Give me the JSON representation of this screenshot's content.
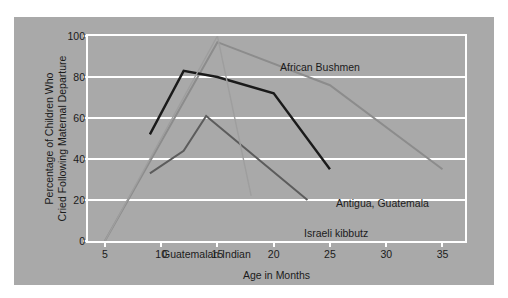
{
  "chart_data": {
    "type": "line",
    "title": "",
    "xlabel": "Age in Months",
    "ylabel": "Percentage of Children Who\nCried Following Maternal Departure",
    "ylabel_line1": "Percentage of Children Who",
    "ylabel_line2": "Cried Following Maternal Departure",
    "xlim": [
      3.5,
      37
    ],
    "ylim": [
      0,
      100
    ],
    "xticks": [
      5,
      10,
      15,
      20,
      25,
      30,
      35
    ],
    "yticks": [
      0,
      20,
      40,
      60,
      80,
      100
    ],
    "grid": true,
    "legend_position": "inline-annotations",
    "background_color": "#a9a9a9",
    "gridline_color": "#ffffff",
    "series": [
      {
        "name": "African Bushmen",
        "color": "#8c8c8c",
        "width": 2.0,
        "points": [
          [
            5,
            0
          ],
          [
            15,
            97
          ],
          [
            25,
            76
          ],
          [
            35,
            35
          ]
        ],
        "label": {
          "text": "African Bushmen",
          "x_px": 266,
          "y_px": 45
        }
      },
      {
        "name": "Antigua, Guatemala",
        "color": "#1a1a1a",
        "width": 2.4,
        "points": [
          [
            9,
            52
          ],
          [
            12,
            83
          ],
          [
            15,
            80
          ],
          [
            20,
            72
          ],
          [
            25,
            35
          ]
        ],
        "label": {
          "text": "Antigua, Guatemala",
          "x_px": 322,
          "y_px": 181
        }
      },
      {
        "name": "Israeli kibbutz",
        "color": "#5c5c5c",
        "width": 2.0,
        "points": [
          [
            9,
            33
          ],
          [
            12,
            44
          ],
          [
            14,
            61
          ],
          [
            23,
            20
          ]
        ],
        "label": {
          "text": "Israeli kibbutz",
          "x_px": 290,
          "y_px": 211
        }
      },
      {
        "name": "Guatemalan Indian",
        "color": "#9e9e9e",
        "width": 1.4,
        "points": [
          [
            5,
            0
          ],
          [
            15,
            100
          ],
          [
            18,
            22
          ]
        ],
        "label": {
          "text": "Guatemalan Indian",
          "x_px": 148,
          "y_px": 232
        }
      }
    ]
  }
}
